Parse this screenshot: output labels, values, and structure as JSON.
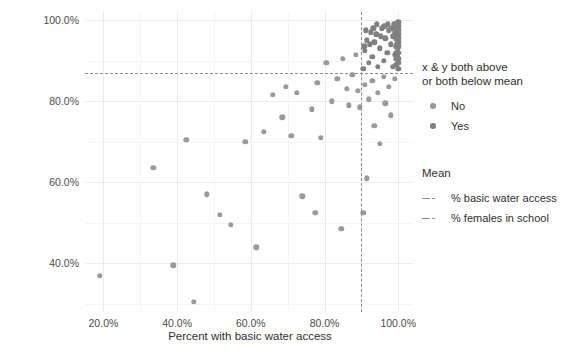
{
  "chart_data": {
    "type": "scatter",
    "title": "",
    "xlabel": "Percent with basic water access",
    "ylabel": "Percent of school-aged females in school",
    "xlim": [
      15,
      104
    ],
    "ylim": [
      28,
      102
    ],
    "xticks": [
      "20.0%",
      "40.0%",
      "60.0%",
      "80.0%",
      "100.0%"
    ],
    "xtick_values": [
      20,
      40,
      60,
      80,
      100
    ],
    "yticks": [
      "40.0%",
      "60.0%",
      "80.0%",
      "100.0%"
    ],
    "ytick_values": [
      40,
      60,
      80,
      100
    ],
    "grid": true,
    "legend_position": "right",
    "mean_x": 90.0,
    "mean_y": 87.0,
    "series": [
      {
        "name": "No",
        "color": "#9a9a9a",
        "points": [
          [
            19.0,
            37.0
          ],
          [
            33.5,
            63.5
          ],
          [
            39.0,
            39.5
          ],
          [
            42.5,
            70.5
          ],
          [
            44.5,
            30.5
          ],
          [
            48.0,
            57.0
          ],
          [
            51.5,
            52.0
          ],
          [
            54.5,
            49.5
          ],
          [
            58.5,
            70.0
          ],
          [
            61.5,
            44.0
          ],
          [
            63.5,
            72.5
          ],
          [
            66.0,
            81.5
          ],
          [
            68.5,
            76.0
          ],
          [
            69.5,
            83.5
          ],
          [
            71.0,
            71.5
          ],
          [
            72.5,
            82.0
          ],
          [
            74.0,
            56.5
          ],
          [
            76.5,
            78.0
          ],
          [
            77.5,
            52.5
          ],
          [
            78.0,
            84.5
          ],
          [
            79.0,
            71.0
          ],
          [
            80.5,
            89.5
          ],
          [
            82.0,
            80.0
          ],
          [
            83.5,
            85.5
          ],
          [
            84.5,
            48.5
          ],
          [
            85.0,
            90.5
          ],
          [
            86.0,
            83.0
          ],
          [
            86.5,
            79.0
          ],
          [
            87.5,
            86.5
          ],
          [
            88.5,
            91.5
          ],
          [
            89.0,
            82.5
          ],
          [
            89.5,
            78.5
          ],
          [
            91.0,
            84.0
          ],
          [
            92.0,
            80.5
          ],
          [
            93.0,
            85.0
          ],
          [
            93.5,
            74.0
          ],
          [
            94.5,
            82.0
          ],
          [
            95.0,
            69.5
          ],
          [
            96.0,
            86.0
          ],
          [
            96.5,
            79.5
          ],
          [
            97.5,
            83.5
          ],
          [
            98.0,
            76.5
          ],
          [
            99.0,
            85.5
          ],
          [
            90.5,
            52.5
          ],
          [
            91.5,
            61.0
          ]
        ]
      },
      {
        "name": "Yes",
        "color": "#808080",
        "points": [
          [
            90.5,
            88.0
          ],
          [
            91.0,
            92.5
          ],
          [
            91.5,
            95.0
          ],
          [
            92.0,
            89.5
          ],
          [
            92.5,
            97.0
          ],
          [
            93.0,
            91.0
          ],
          [
            93.5,
            94.5
          ],
          [
            94.0,
            96.5
          ],
          [
            94.5,
            88.5
          ],
          [
            95.0,
            93.0
          ],
          [
            95.5,
            98.0
          ],
          [
            96.0,
            90.0
          ],
          [
            96.5,
            95.5
          ],
          [
            97.0,
            92.0
          ],
          [
            97.5,
            97.5
          ],
          [
            98.0,
            94.0
          ],
          [
            98.5,
            88.5
          ],
          [
            98.5,
            96.0
          ],
          [
            99.0,
            91.5
          ],
          [
            99.0,
            98.5
          ],
          [
            99.3,
            93.5
          ],
          [
            99.3,
            95.5
          ],
          [
            99.5,
            89.0
          ],
          [
            99.5,
            90.5
          ],
          [
            99.5,
            92.0
          ],
          [
            99.6,
            94.0
          ],
          [
            99.6,
            96.5
          ],
          [
            99.7,
            97.5
          ],
          [
            99.7,
            98.5
          ],
          [
            99.8,
            99.2
          ],
          [
            99.8,
            91.0
          ],
          [
            99.8,
            93.0
          ],
          [
            99.9,
            95.0
          ],
          [
            99.9,
            96.0
          ],
          [
            100.0,
            88.0
          ],
          [
            100.0,
            89.5
          ],
          [
            100.0,
            90.5
          ],
          [
            100.0,
            92.0
          ],
          [
            100.0,
            93.5
          ],
          [
            100.0,
            94.5
          ],
          [
            100.0,
            95.5
          ],
          [
            100.0,
            96.5
          ],
          [
            100.0,
            97.5
          ],
          [
            100.0,
            98.5
          ],
          [
            100.0,
            99.5
          ],
          [
            99.4,
            99.0
          ],
          [
            99.2,
            97.0
          ],
          [
            98.8,
            99.0
          ],
          [
            98.2,
            98.0
          ],
          [
            97.2,
            99.0
          ],
          [
            96.2,
            98.5
          ],
          [
            95.2,
            96.0
          ],
          [
            94.2,
            99.0
          ],
          [
            93.2,
            98.0
          ],
          [
            92.2,
            94.0
          ],
          [
            91.2,
            97.5
          ],
          [
            90.8,
            93.5
          ]
        ]
      }
    ]
  },
  "legend_class": {
    "title_line1": "x & y both above",
    "title_line2": "or both below mean",
    "items": [
      {
        "label": "No",
        "color": "#9a9a9a"
      },
      {
        "label": "Yes",
        "color": "#808080"
      }
    ]
  },
  "legend_mean": {
    "title": "Mean",
    "items": [
      {
        "label": "% basic water access",
        "color": "#8c8c8c"
      },
      {
        "label": "% females in school",
        "color": "#8c8c8c"
      }
    ]
  }
}
